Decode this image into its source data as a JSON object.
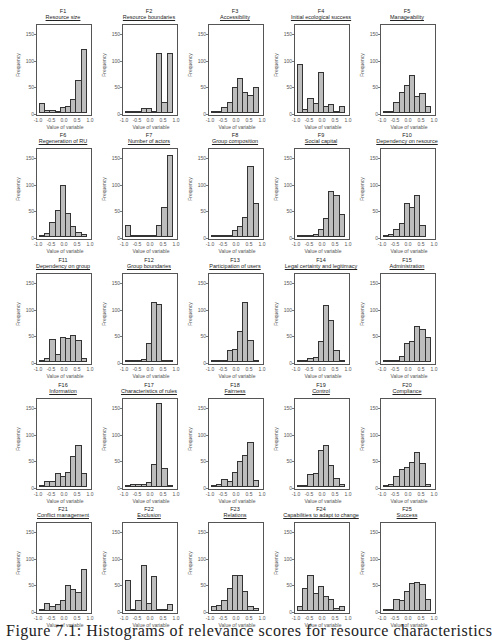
{
  "chart_data": {
    "type": "bar",
    "layout": {
      "rows": 5,
      "cols": 5,
      "bins": [
        -1.0,
        -0.8,
        -0.6,
        -0.4,
        -0.2,
        0.0,
        0.2,
        0.4,
        0.6,
        0.8,
        1.0
      ]
    },
    "common": {
      "xlabel": "Value of variable",
      "ylabel": "Frequency",
      "xticks": [
        "-1.0",
        "-0.5",
        "0.0",
        "0.5",
        "1.0"
      ],
      "yticks": [
        "0",
        "50",
        "100",
        "150"
      ],
      "ylim": [
        0,
        165
      ],
      "xlim": [
        -1.0,
        1.0
      ],
      "grid": false
    },
    "panels": [
      {
        "id": "F1",
        "title": "Resource size",
        "values": [
          18,
          5,
          5,
          4,
          12,
          14,
          27,
          62,
          120,
          0
        ]
      },
      {
        "id": "F2",
        "title": "Resource boundaries",
        "values": [
          1,
          1,
          2,
          10,
          9,
          4,
          112,
          20,
          112,
          0
        ]
      },
      {
        "id": "F3",
        "title": "Accessibility",
        "values": [
          1,
          3,
          12,
          20,
          48,
          65,
          40,
          33,
          48,
          0
        ]
      },
      {
        "id": "F4",
        "title": "Initial ecological success",
        "values": [
          92,
          8,
          28,
          19,
          77,
          13,
          16,
          2,
          14,
          0
        ]
      },
      {
        "id": "F5",
        "title": "Manageability",
        "values": [
          2,
          4,
          20,
          40,
          53,
          72,
          32,
          37,
          14,
          0
        ]
      },
      {
        "id": "F6",
        "title": "Regeneration of RU",
        "values": [
          2,
          7,
          28,
          50,
          98,
          45,
          20,
          10,
          5,
          0
        ]
      },
      {
        "id": "F7",
        "title": "Number of actors",
        "values": [
          22,
          1,
          3,
          2,
          2,
          4,
          22,
          57,
          153,
          0
        ]
      },
      {
        "id": "F8",
        "title": "Group composition",
        "values": [
          1,
          1,
          1,
          3,
          14,
          20,
          37,
          133,
          64,
          0
        ]
      },
      {
        "id": "F9",
        "title": "Social capital",
        "values": [
          2,
          2,
          2,
          5,
          15,
          35,
          86,
          78,
          43,
          0
        ]
      },
      {
        "id": "F10",
        "title": "Dependency on resource",
        "values": [
          2,
          5,
          15,
          27,
          63,
          57,
          78,
          22,
          0,
          0
        ]
      },
      {
        "id": "F11",
        "title": "Dependency on group",
        "values": [
          3,
          8,
          44,
          15,
          46,
          45,
          51,
          42,
          8,
          0
        ]
      },
      {
        "id": "F12",
        "title": "Group boundaries",
        "values": [
          1,
          1,
          3,
          5,
          35,
          112,
          108,
          2,
          1,
          0
        ]
      },
      {
        "id": "F13",
        "title": "Participation of users",
        "values": [
          1,
          2,
          3,
          22,
          25,
          59,
          113,
          42,
          2,
          0
        ]
      },
      {
        "id": "F14",
        "title": "Legal certainty and legitimacy",
        "values": [
          1,
          3,
          7,
          10,
          40,
          107,
          79,
          22,
          2,
          0
        ]
      },
      {
        "id": "F15",
        "title": "Administration",
        "values": [
          3,
          1,
          2,
          11,
          35,
          40,
          68,
          62,
          47,
          0
        ]
      },
      {
        "id": "F16",
        "title": "Information",
        "values": [
          4,
          12,
          11,
          26,
          21,
          29,
          58,
          78,
          26,
          0
        ]
      },
      {
        "id": "F17",
        "title": "Characteristics of rules",
        "values": [
          1,
          6,
          6,
          5,
          9,
          43,
          158,
          36,
          2,
          0
        ]
      },
      {
        "id": "F18",
        "title": "Fairness",
        "values": [
          4,
          5,
          15,
          12,
          28,
          48,
          60,
          84,
          14,
          0
        ]
      },
      {
        "id": "F19",
        "title": "Control",
        "values": [
          2,
          4,
          24,
          27,
          70,
          78,
          42,
          17,
          5,
          0
        ]
      },
      {
        "id": "F20",
        "title": "Compliance",
        "values": [
          4,
          6,
          21,
          34,
          38,
          47,
          66,
          45,
          5,
          0
        ]
      },
      {
        "id": "F21",
        "title": "Conflict management",
        "values": [
          4,
          15,
          9,
          14,
          21,
          49,
          41,
          36,
          79,
          0
        ]
      },
      {
        "id": "F22",
        "title": "Exclusion",
        "values": [
          59,
          2,
          20,
          87,
          15,
          65,
          3,
          2,
          13,
          0
        ]
      },
      {
        "id": "F23",
        "title": "Relations",
        "values": [
          9,
          11,
          20,
          43,
          68,
          68,
          38,
          10,
          6,
          0
        ]
      },
      {
        "id": "F24",
        "title": "Capabilities to adapt to change",
        "values": [
          10,
          43,
          67,
          34,
          46,
          28,
          22,
          6,
          9,
          0
        ]
      },
      {
        "id": "F25",
        "title": "Success",
        "values": [
          1,
          4,
          22,
          21,
          37,
          52,
          55,
          51,
          22,
          0
        ]
      }
    ]
  },
  "caption": "Figure 7.1: Histograms of relevance scores for resource characteristics"
}
